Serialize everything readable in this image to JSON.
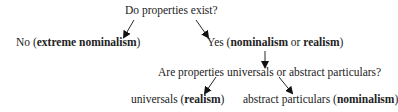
{
  "diagram": {
    "type": "decision-tree",
    "nodes": {
      "root": {
        "text": "Do properties exist?"
      },
      "no": {
        "prefix": "No (",
        "bold": "extreme nominalism",
        "suffix": ")"
      },
      "yes": {
        "prefix": "Yes (",
        "bold1": "nominalism",
        "middle": " or ",
        "bold2": "realism",
        "suffix": ")"
      },
      "question2": {
        "text": "Are properties universals or abstract particulars?"
      },
      "universals": {
        "prefix": "universals (",
        "bold": "realism",
        "suffix": ")"
      },
      "particulars": {
        "prefix": "abstract particulars (",
        "bold": "nominalism",
        "suffix": ")"
      }
    },
    "edges": [
      {
        "from": "root",
        "to": "no"
      },
      {
        "from": "root",
        "to": "yes"
      },
      {
        "from": "yes",
        "to": "question2"
      },
      {
        "from": "question2",
        "to": "universals"
      },
      {
        "from": "question2",
        "to": "particulars"
      }
    ]
  }
}
